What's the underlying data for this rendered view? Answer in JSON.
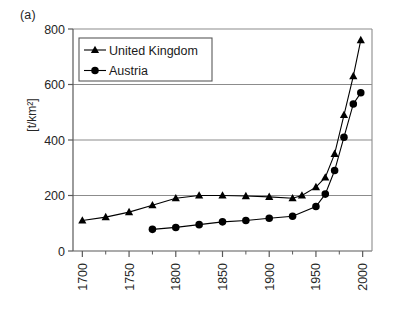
{
  "figure": {
    "panel_label": "(a)",
    "y_axis_title": "[t/km²]"
  },
  "chart_data": {
    "type": "line",
    "title": "",
    "subtitle": "",
    "panel_label": "(a)",
    "xlabel": "",
    "ylabel": "[t/km²]",
    "xlim": [
      1690,
      2010
    ],
    "ylim": [
      0,
      800
    ],
    "xticks": [
      1700,
      1750,
      1800,
      1850,
      1900,
      1950,
      2000
    ],
    "xtick_labels": [
      "1700",
      "1750",
      "1800",
      "1850",
      "1900",
      "1950",
      "2000"
    ],
    "xtick_rotation": 90,
    "xminorticks": [
      1725,
      1775,
      1825,
      1875,
      1925,
      1975
    ],
    "yticks": [
      0,
      200,
      400,
      600,
      800
    ],
    "ytick_labels": [
      "0",
      "200",
      "400",
      "600",
      "800"
    ],
    "grid": "horizontal",
    "legend_position": "upper left",
    "series": [
      {
        "name": "United Kingdom",
        "marker": "triangle",
        "color": "#000000",
        "x": [
          1700,
          1725,
          1750,
          1775,
          1800,
          1825,
          1850,
          1875,
          1900,
          1925,
          1935,
          1950,
          1960,
          1970,
          1980,
          1990,
          1998
        ],
        "values": [
          110,
          122,
          140,
          165,
          190,
          200,
          200,
          198,
          195,
          190,
          200,
          230,
          265,
          350,
          490,
          630,
          760
        ]
      },
      {
        "name": "Austria",
        "marker": "circle",
        "color": "#000000",
        "x": [
          1775,
          1800,
          1825,
          1850,
          1875,
          1900,
          1925,
          1950,
          1960,
          1970,
          1980,
          1990,
          1998
        ],
        "values": [
          78,
          85,
          95,
          105,
          110,
          118,
          125,
          160,
          205,
          290,
          410,
          530,
          570
        ]
      }
    ]
  },
  "legend": {
    "entries": [
      {
        "label": "United Kingdom",
        "marker": "triangle"
      },
      {
        "label": "Austria",
        "marker": "circle"
      }
    ]
  }
}
